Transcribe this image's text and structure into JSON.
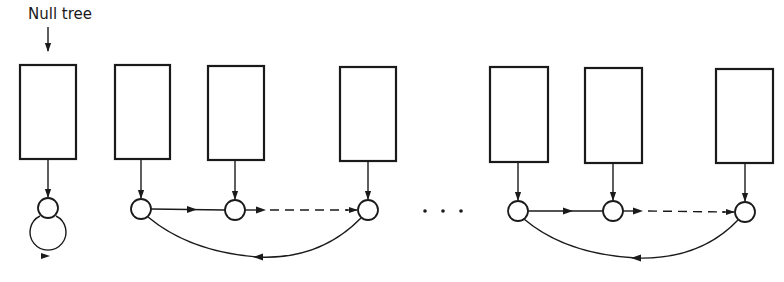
{
  "diagram": {
    "label": "Null tree",
    "ellipsis": "...",
    "colors": {
      "stroke": "#1a1a1a",
      "background": "#ffffff"
    },
    "boxes": [
      {
        "id": "box-null",
        "x": 20,
        "y": 65,
        "w": 56,
        "h": 94
      },
      {
        "id": "box-2",
        "x": 115,
        "y": 65,
        "w": 55,
        "h": 94
      },
      {
        "id": "box-3",
        "x": 208,
        "y": 66,
        "w": 56,
        "h": 94
      },
      {
        "id": "box-4",
        "x": 340,
        "y": 67,
        "w": 56,
        "h": 94
      },
      {
        "id": "box-5",
        "x": 490,
        "y": 67,
        "w": 58,
        "h": 95
      },
      {
        "id": "box-6",
        "x": 585,
        "y": 68,
        "w": 57,
        "h": 95
      },
      {
        "id": "box-7",
        "x": 716,
        "y": 69,
        "w": 57,
        "h": 94
      }
    ],
    "nodes": [
      {
        "id": "node-null",
        "cx": 48,
        "cy": 208,
        "r": 10
      },
      {
        "id": "node-1a",
        "cx": 141,
        "cy": 209,
        "r": 10
      },
      {
        "id": "node-1b",
        "cx": 235,
        "cy": 210,
        "r": 10
      },
      {
        "id": "node-1c",
        "cx": 368,
        "cy": 210,
        "r": 10
      },
      {
        "id": "node-2a",
        "cx": 518,
        "cy": 211,
        "r": 10
      },
      {
        "id": "node-2b",
        "cx": 613,
        "cy": 211,
        "r": 10
      },
      {
        "id": "node-2c",
        "cx": 745,
        "cy": 212,
        "r": 10
      }
    ],
    "groups": [
      {
        "name": "null-tree",
        "nodes": 1,
        "self_loop": true
      },
      {
        "name": "list-1",
        "nodes": 3,
        "circular": true
      },
      {
        "name": "list-2",
        "nodes": 3,
        "circular": true
      }
    ]
  }
}
